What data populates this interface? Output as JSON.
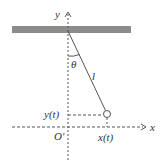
{
  "diagram": {
    "type": "simple-pendulum",
    "labels": {
      "y_axis": "y",
      "x_axis": "x",
      "origin": "O'",
      "angle": "θ",
      "length": "l",
      "y_of_t": "y(t)",
      "x_of_t": "x(t)"
    },
    "colors": {
      "ceiling": "#8c8c8c",
      "line": "#555555",
      "text": "#333333"
    }
  }
}
